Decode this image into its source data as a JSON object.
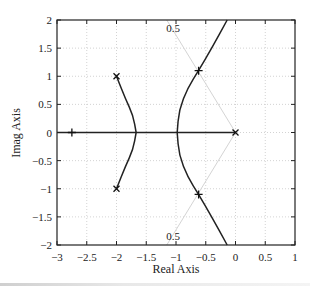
{
  "chart_data": {
    "type": "line",
    "title": "",
    "subtitle": "",
    "xlabel": "Real Axis",
    "ylabel": "Imag Axis",
    "xlim": [
      -3,
      1
    ],
    "ylim": [
      -2,
      2
    ],
    "xticks": [
      -3,
      -2.5,
      -2,
      -1.5,
      -1,
      -0.5,
      0,
      0.5,
      1
    ],
    "yticks": [
      -2,
      -1.5,
      -1,
      -0.5,
      0,
      0.5,
      1,
      1.5,
      2
    ],
    "xtick_labels": [
      "−3",
      "−2.5",
      "−2",
      "−1.5",
      "−1",
      "−0.5",
      "0",
      "0.5",
      "1"
    ],
    "ytick_labels": [
      "−2",
      "−1.5",
      "−1",
      "−0.5",
      "0",
      "0.5",
      "1",
      "1.5",
      "2"
    ],
    "grid": true,
    "legend": null,
    "poles": [
      {
        "re": 0,
        "im": 0
      },
      {
        "re": -2,
        "im": 1
      },
      {
        "re": -2,
        "im": -1
      }
    ],
    "closed_loop_markers": [
      {
        "re": -2.75,
        "im": 0
      },
      {
        "re": -0.62,
        "im": 1.1
      },
      {
        "re": -0.62,
        "im": -1.1
      }
    ],
    "series": [
      {
        "name": "real-axis-branch",
        "points": [
          [
            -3,
            0
          ],
          [
            0,
            0
          ]
        ]
      },
      {
        "name": "left-upper-branch",
        "points": [
          [
            -2,
            1
          ],
          [
            -1.85,
            0.6
          ],
          [
            -1.72,
            0.3
          ],
          [
            -1.67,
            0
          ]
        ]
      },
      {
        "name": "left-lower-branch",
        "points": [
          [
            -1.67,
            0
          ],
          [
            -1.72,
            -0.3
          ],
          [
            -1.85,
            -0.6
          ],
          [
            -2,
            -1
          ]
        ]
      },
      {
        "name": "right-upper-branch",
        "points": [
          [
            -0.98,
            0
          ],
          [
            -0.95,
            0.4
          ],
          [
            -0.8,
            0.8
          ],
          [
            -0.62,
            1.1
          ],
          [
            -0.4,
            1.5
          ],
          [
            -0.14,
            2
          ]
        ]
      },
      {
        "name": "right-lower-branch",
        "points": [
          [
            -0.98,
            0
          ],
          [
            -0.95,
            -0.4
          ],
          [
            -0.8,
            -0.8
          ],
          [
            -0.62,
            -1.1
          ],
          [
            -0.4,
            -1.5
          ],
          [
            -0.14,
            -2
          ]
        ]
      }
    ],
    "damping_lines": [
      {
        "zeta": 0.5,
        "label": "0.5",
        "points": [
          [
            0,
            0
          ],
          [
            -1.155,
            2
          ]
        ]
      },
      {
        "zeta": 0.5,
        "label": "0.5",
        "points": [
          [
            0,
            0
          ],
          [
            -1.155,
            -2
          ]
        ]
      }
    ],
    "annotations": [
      "0.5",
      "0.5"
    ]
  }
}
